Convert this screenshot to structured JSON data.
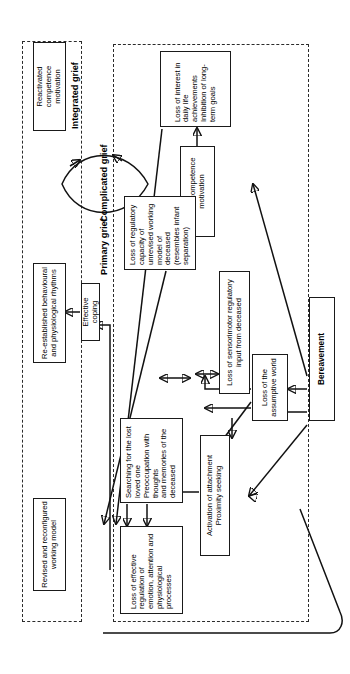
{
  "figure": {
    "type": "flowchart",
    "orientation": "rotated-90-ccw"
  },
  "groups": [
    {
      "id": "primary-grief",
      "label": "Primary grief"
    },
    {
      "id": "integrated-grief",
      "label": "Integrated grief"
    }
  ],
  "nodes": {
    "bereavement": "Bereavement",
    "assumptive_world": "Loss of the\nassumptive world",
    "sensorimotor": "Loss of sensorimotor regulatory\ninput from deceased",
    "attachment": "Activation of attachment\nProximity seeking",
    "competence": "Loss of competence\nmotivation",
    "interest": "Loss of interest in daily life\nachievements\nInhibition of long-term goals",
    "regulatory": "Loss of regulatory capacity of\nunrevised working model of\ndeceased\n(resembles infant separation)",
    "searching": "Searching for the lost loved one\nPreoccupation with thoughts\nand memories of the deceased",
    "effective_regulation": "Loss of effective regulation of\nemotion, attention and\nphysiological processes",
    "complicated": "Complicated grief",
    "coping": "Effective  coping",
    "reactivated": "Reactivated competence\nmotivation",
    "rhythms": "Re-established behavioural\nand physiological rhythms",
    "working_model": "Revised and reconfigured\nworking model"
  },
  "colors": {
    "stroke": "#111111",
    "box_border": "#1a1a1a",
    "group_border": "#2b2b2b",
    "background": "#ffffff"
  }
}
